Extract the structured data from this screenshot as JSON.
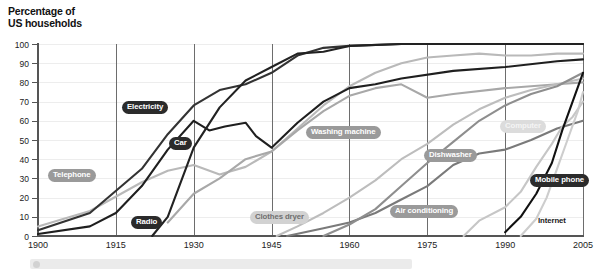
{
  "title": "Percentage of\nUS households",
  "chart_data": {
    "type": "line",
    "title": "Percentage of US households",
    "xlabel": "",
    "ylabel": "Percentage of US households",
    "xlim": [
      1900,
      2005
    ],
    "ylim": [
      0,
      100
    ],
    "grid": true,
    "legend": "inline-labels",
    "xticks": [
      "1900",
      "1915",
      "1930",
      "1945",
      "1960",
      "1975",
      "1990",
      "2005"
    ],
    "yticks": [
      "0",
      "10",
      "20",
      "30",
      "40",
      "50",
      "60",
      "70",
      "80",
      "90",
      "100"
    ],
    "series": [
      {
        "name": "Telephone",
        "color": "#b9b9b9",
        "label_style": "mid",
        "x": [
          1900,
          1910,
          1920,
          1925,
          1930,
          1935,
          1940,
          1945,
          1950,
          1955,
          1960,
          1965,
          1970,
          1975,
          1980,
          1985,
          1990,
          1995,
          2000,
          2005
        ],
        "y": [
          5,
          13,
          28,
          34,
          37,
          32,
          36,
          44,
          56,
          68,
          78,
          85,
          90,
          93,
          94,
          95,
          94,
          94,
          95,
          95
        ]
      },
      {
        "name": "Electricity",
        "color": "#333333",
        "label_style": "dark",
        "x": [
          1900,
          1910,
          1920,
          1925,
          1930,
          1935,
          1940,
          1945,
          1950,
          1955,
          1960,
          1970,
          1980,
          1990,
          2000,
          2005
        ],
        "y": [
          3,
          12,
          35,
          53,
          68,
          76,
          79,
          85,
          94,
          98,
          99,
          100,
          100,
          100,
          100,
          100
        ]
      },
      {
        "name": "Car",
        "color": "#1f1f1f",
        "label_style": "dark",
        "x": [
          1900,
          1910,
          1915,
          1920,
          1925,
          1930,
          1933,
          1936,
          1940,
          1942,
          1945,
          1950,
          1955,
          1960,
          1965,
          1970,
          1980,
          1990,
          2000,
          2005
        ],
        "y": [
          1,
          5,
          12,
          26,
          45,
          60,
          55,
          57,
          59,
          52,
          46,
          59,
          70,
          77,
          79,
          82,
          86,
          88,
          91,
          92
        ]
      },
      {
        "name": "Radio",
        "color": "#222222",
        "label_style": "dark",
        "x": [
          1922,
          1925,
          1930,
          1935,
          1940,
          1945,
          1950,
          1955,
          1960,
          1970,
          1980,
          1990,
          2005
        ],
        "y": [
          0,
          10,
          46,
          67,
          81,
          88,
          95,
          96,
          99,
          100,
          100,
          100,
          100
        ]
      },
      {
        "name": "Washing machine",
        "color": "#a8a8a8",
        "label_style": "mid",
        "x": [
          1925,
          1930,
          1935,
          1940,
          1945,
          1950,
          1955,
          1960,
          1965,
          1970,
          1975,
          1980,
          1990,
          2000,
          2005
        ],
        "y": [
          7,
          22,
          30,
          40,
          44,
          55,
          65,
          73,
          77,
          79,
          72,
          74,
          77,
          79,
          80
        ]
      },
      {
        "name": "Clothes dryer",
        "color": "#bdbdbd",
        "label_style": "light",
        "x": [
          1946,
          1950,
          1955,
          1960,
          1965,
          1970,
          1975,
          1980,
          1985,
          1990,
          1995,
          2000,
          2005
        ],
        "y": [
          0,
          5,
          12,
          20,
          29,
          40,
          48,
          58,
          66,
          72,
          76,
          79,
          82
        ]
      },
      {
        "name": "Dishwasher",
        "color": "#7a7a7a",
        "label_style": "mid",
        "x": [
          1948,
          1955,
          1960,
          1965,
          1970,
          1975,
          1980,
          1985,
          1990,
          1995,
          2000,
          2005
        ],
        "y": [
          0,
          4,
          7,
          12,
          19,
          26,
          37,
          43,
          45,
          50,
          56,
          60
        ]
      },
      {
        "name": "Air conditioning",
        "color": "#8e8e8e",
        "label_style": "mid",
        "x": [
          1955,
          1960,
          1965,
          1970,
          1975,
          1980,
          1985,
          1990,
          1995,
          2000,
          2005
        ],
        "y": [
          0,
          6,
          14,
          26,
          38,
          49,
          60,
          68,
          74,
          78,
          85
        ]
      },
      {
        "name": "Computer",
        "color": "#c6c6c6",
        "label_style": "vlight",
        "x": [
          1982,
          1985,
          1990,
          1993,
          1996,
          1999,
          2001,
          2003,
          2005
        ],
        "y": [
          0,
          8,
          15,
          23,
          36,
          48,
          57,
          62,
          70
        ]
      },
      {
        "name": "Mobile phone",
        "color": "#111111",
        "label_style": "dark",
        "x": [
          1990,
          1993,
          1996,
          1999,
          2001,
          2003,
          2005
        ],
        "y": [
          2,
          10,
          22,
          38,
          55,
          70,
          85
        ]
      },
      {
        "name": "Internet",
        "color": "#cdcdcd",
        "label_style": "plain",
        "x": [
          1993,
          1996,
          1998,
          2000,
          2002,
          2004,
          2005
        ],
        "y": [
          0,
          9,
          20,
          35,
          50,
          65,
          75
        ]
      }
    ]
  }
}
